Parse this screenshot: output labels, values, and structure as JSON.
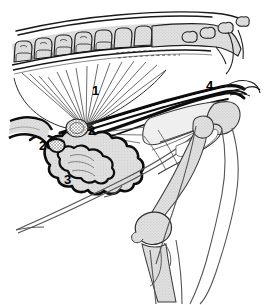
{
  "figure": {
    "type": "anatomical-line-illustration",
    "view": "median sagittal section of the caudal abdomen and pelvis of a quadruped (female)",
    "width_px": 268,
    "height_px": 305,
    "background_color": "#ffffff",
    "ink_color": "#000000",
    "bone_fill_color": "#d9d9d9",
    "stipple_color": "#8c8c8c"
  },
  "labels": [
    {
      "id": "1",
      "text": "1",
      "x": 92,
      "y": 84,
      "target": "fan-shaped-suspensory-ligament"
    },
    {
      "id": "2",
      "text": "2",
      "x": 88,
      "y": 124,
      "target": "stippled-ovoid-organ"
    },
    {
      "id": "2p",
      "text": "2'",
      "x": 39,
      "y": 139,
      "target": "cranial-tip-of-organ"
    },
    {
      "id": "3",
      "text": "3",
      "x": 64,
      "y": 173,
      "target": "lobulated-scalloped-organ"
    },
    {
      "id": "4",
      "text": "4",
      "x": 206,
      "y": 79,
      "target": "pelvic-inlet-structure"
    }
  ],
  "structures": {
    "vertebral_column": "lumbar vertebrae with spinous processes, upper left",
    "sacrum": "fused sacral segments, upper right",
    "caudal_vertebrae": "tail vertebrae, top right corner",
    "pelvis": "ilium, ischium and pubis outlines, right of centre",
    "hind_limb": "femur, patella, stifle joint and tibia, lower right",
    "body_contour": "thin outline of abdominal wall and flank sweeping to lower left",
    "tubular_organs": "two heavy dark tubular structures running craniocaudally across the pelvic inlet",
    "fan_lines": "radiating fan of fine lines representing suspensory/broad ligament fibres"
  }
}
